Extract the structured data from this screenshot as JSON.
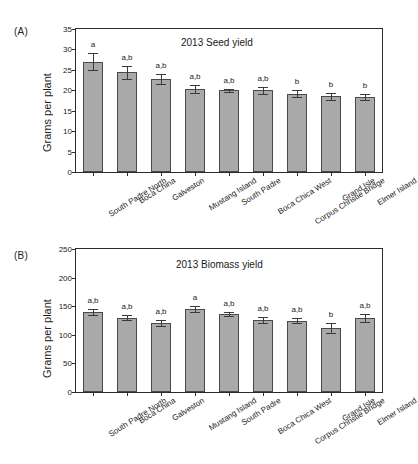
{
  "figure": {
    "categories": [
      "South Padre North",
      "Boca China",
      "Galveston",
      "Mustang Island",
      "South Padre",
      "Boca Chica West",
      "Corpus Christie Bridge",
      "Grand Isle",
      "Elmer Island"
    ]
  },
  "panel_a": {
    "letter": "(A)",
    "ylabel": "Grams per plant"
  },
  "panel_b": {
    "letter": "(B)",
    "ylabel": "Grams per plant"
  },
  "chart_data": [
    {
      "type": "bar",
      "panel": "(A)",
      "title": "2013 Seed yield",
      "xlabel": "",
      "ylabel": "Grams per plant",
      "ylim": [
        0,
        35
      ],
      "yticks": [
        0,
        5,
        10,
        15,
        20,
        25,
        30,
        35
      ],
      "grid": false,
      "legend": "none",
      "bar_color": "#a9a9a9",
      "categories": [
        "South Padre North",
        "Boca China",
        "Galveston",
        "Mustang Island",
        "South Padre",
        "Boca Chica West",
        "Corpus Christie Bridge",
        "Grand Isle",
        "Elmer Island"
      ],
      "values": [
        27.0,
        24.4,
        22.8,
        20.3,
        20.0,
        20.0,
        19.2,
        18.5,
        18.4
      ],
      "errors": [
        2.1,
        1.6,
        1.2,
        0.9,
        0.4,
        0.9,
        0.9,
        0.8,
        0.8
      ],
      "annotations": [
        "a",
        "a,b",
        "a,b",
        "a,b",
        "a,b",
        "a,b",
        "b",
        "b",
        "b"
      ]
    },
    {
      "type": "bar",
      "panel": "(B)",
      "title": "2013 Biomass yield",
      "xlabel": "",
      "ylabel": "Grams per plant",
      "ylim": [
        0,
        250
      ],
      "yticks": [
        0,
        50,
        100,
        150,
        200,
        250
      ],
      "grid": false,
      "legend": "none",
      "bar_color": "#a9a9a9",
      "categories": [
        "South Padre North",
        "Boca China",
        "Galveston",
        "Mustang Island",
        "South Padre",
        "Boca Chica West",
        "Corpus Christie Bridge",
        "Grand Isle",
        "Elmer Island"
      ],
      "values": [
        140,
        130,
        121,
        145,
        136,
        126,
        125,
        112,
        129
      ],
      "errors": [
        5,
        4,
        5,
        5,
        3,
        5,
        5,
        9,
        7
      ],
      "annotations": [
        "a,b",
        "a,b",
        "a,b",
        "a",
        "a,b",
        "a,b",
        "a,b",
        "b",
        "a,b"
      ]
    }
  ]
}
